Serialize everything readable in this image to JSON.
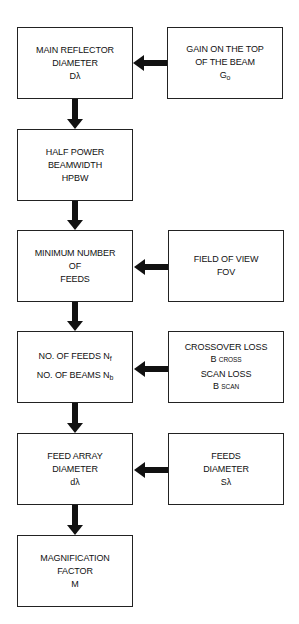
{
  "diagram": {
    "left_column": [
      {
        "id": "main-reflector",
        "lines": [
          "MAIN REFLECTOR",
          "DIAMETER",
          "Dλ"
        ]
      },
      {
        "id": "hpbw",
        "lines": [
          "HALF POWER",
          "BEAMWIDTH",
          "HPBW"
        ]
      },
      {
        "id": "min-feeds",
        "lines": [
          "MINIMUM NUMBER",
          "OF",
          "FEEDS"
        ]
      },
      {
        "id": "feeds-beams",
        "line1_main": "NO. OF FEEDS N",
        "line1_sub": "f",
        "line2_main": "NO. OF BEAMS N",
        "line2_sub": "b"
      },
      {
        "id": "feed-array",
        "lines": [
          "FEED ARRAY",
          "DIAMETER",
          "dλ"
        ]
      },
      {
        "id": "magnification",
        "lines": [
          "MAGNIFICATION",
          "FACTOR",
          "M"
        ]
      }
    ],
    "right_column": [
      {
        "id": "gain",
        "line1": "GAIN ON THE TOP",
        "line2": "OF THE BEAM",
        "line3_main": "G",
        "line3_sub": "o"
      },
      {
        "id": "fov",
        "lines": [
          "FIELD OF VIEW",
          "FOV"
        ]
      },
      {
        "id": "losses",
        "line1": "CROSSOVER LOSS",
        "line2_main": "B",
        "line2_sub": "CROSS",
        "line3": "SCAN LOSS",
        "line4_main": "B",
        "line4_sub": "SCAN"
      },
      {
        "id": "feeds-diameter",
        "lines": [
          "FEEDS",
          "DIAMETER",
          "Sλ"
        ]
      }
    ],
    "connections": [
      {
        "from": "gain",
        "to": "main-reflector"
      },
      {
        "from": "main-reflector",
        "to": "hpbw"
      },
      {
        "from": "hpbw",
        "to": "min-feeds"
      },
      {
        "from": "fov",
        "to": "min-feeds"
      },
      {
        "from": "min-feeds",
        "to": "feeds-beams"
      },
      {
        "from": "losses",
        "to": "feeds-beams"
      },
      {
        "from": "feeds-beams",
        "to": "feed-array"
      },
      {
        "from": "feeds-diameter",
        "to": "feed-array"
      },
      {
        "from": "feed-array",
        "to": "magnification"
      }
    ]
  }
}
